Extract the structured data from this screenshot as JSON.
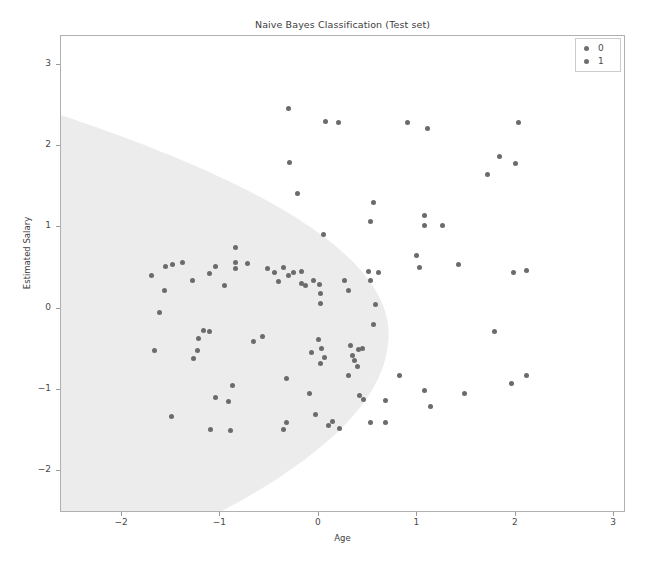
{
  "chart_data": {
    "type": "scatter",
    "title": "Naive Bayes Classification (Test set)",
    "xlabel": "Age",
    "ylabel": "Estimated Salary",
    "xlim": [
      -2.62,
      3.12
    ],
    "ylim": [
      -2.52,
      3.36
    ],
    "xticks": [
      "-2",
      "-1",
      "0",
      "1",
      "2",
      "3"
    ],
    "xtick_values": [
      -2,
      -1,
      0,
      1,
      2,
      3
    ],
    "yticks": [
      "-2",
      "-1",
      "0",
      "1",
      "2",
      "3"
    ],
    "ytick_values": [
      -2,
      -1,
      0,
      1,
      2,
      3
    ],
    "grid": false,
    "legend_position": "upper right",
    "legend": [
      {
        "label": "0",
        "color": "#6f6f6f"
      },
      {
        "label": "1",
        "color": "#6f6f6f"
      }
    ],
    "marker_color": "#6b6b6b",
    "marker_size_px": 5,
    "decision_region": {
      "class_0_fill": "#ececec",
      "class_1_fill": "#ffffff",
      "description": "Large shaded parabolic/elliptical region covering the left portion of the plot, apex near Age = 0.72 at Estimated Salary = -0.33; it meets the left frame edge near Estimated Salary = 2.35 on top and extends below the bottom frame edge."
    },
    "series": [
      {
        "name": "0",
        "color": "#6b6b6b",
        "points": [
          [
            -0.31,
            2.47
          ],
          [
            0.07,
            2.3
          ],
          [
            0.2,
            2.29
          ],
          [
            0.9,
            2.29
          ],
          [
            1.1,
            2.22
          ],
          [
            2.03,
            2.29
          ],
          [
            1.83,
            1.87
          ],
          [
            1.71,
            1.65
          ],
          [
            2.0,
            1.79
          ],
          [
            -0.3,
            1.8
          ],
          [
            -0.22,
            1.42
          ],
          [
            0.55,
            1.31
          ],
          [
            0.05,
            0.91
          ],
          [
            0.52,
            1.07
          ],
          [
            1.07,
            1.15
          ],
          [
            1.07,
            1.03
          ],
          [
            1.26,
            1.03
          ],
          [
            0.99,
            0.66
          ],
          [
            1.02,
            0.51
          ],
          [
            1.42,
            0.54
          ],
          [
            1.98,
            0.44
          ],
          [
            2.11,
            0.47
          ],
          [
            1.78,
            -0.28
          ],
          [
            0.82,
            -0.82
          ],
          [
            1.07,
            -1.01
          ],
          [
            1.13,
            -1.21
          ],
          [
            1.48,
            -1.05
          ],
          [
            0.68,
            -1.13
          ],
          [
            0.68,
            -1.41
          ],
          [
            1.96,
            -0.92
          ],
          [
            2.11,
            -0.82
          ]
        ]
      },
      {
        "name": "1",
        "color": "#6b6b6b",
        "points": [
          [
            -1.7,
            0.41
          ],
          [
            -1.56,
            0.52
          ],
          [
            -1.49,
            0.54
          ],
          [
            -1.39,
            0.57
          ],
          [
            -1.57,
            0.22
          ],
          [
            -1.62,
            -0.05
          ],
          [
            -1.67,
            -0.52
          ],
          [
            -1.5,
            -1.33
          ],
          [
            -1.28,
            0.35
          ],
          [
            -1.05,
            0.52
          ],
          [
            -1.11,
            0.43
          ],
          [
            -0.85,
            0.75
          ],
          [
            -0.85,
            0.57
          ],
          [
            -0.85,
            0.5
          ],
          [
            -0.73,
            0.55
          ],
          [
            -0.96,
            0.29
          ],
          [
            -1.17,
            -0.27
          ],
          [
            -1.11,
            -0.28
          ],
          [
            -1.22,
            -0.37
          ],
          [
            -1.23,
            -0.52
          ],
          [
            -1.27,
            -0.62
          ],
          [
            -1.05,
            -1.1
          ],
          [
            -1.1,
            -1.49
          ],
          [
            -0.88,
            -0.95
          ],
          [
            -0.92,
            -1.15
          ],
          [
            -0.9,
            -1.5
          ],
          [
            -0.66,
            -0.41
          ],
          [
            -0.57,
            -0.34
          ],
          [
            -0.52,
            0.49
          ],
          [
            -0.45,
            0.44
          ],
          [
            -0.41,
            0.33
          ],
          [
            -0.36,
            0.51
          ],
          [
            -0.31,
            0.41
          ],
          [
            -0.33,
            -0.86
          ],
          [
            -0.36,
            -1.49
          ],
          [
            -0.33,
            -1.41
          ],
          [
            -0.26,
            0.44
          ],
          [
            -0.18,
            0.46
          ],
          [
            -0.18,
            0.31
          ],
          [
            -0.14,
            0.29
          ],
          [
            -0.05,
            0.35
          ],
          [
            0.01,
            0.3
          ],
          [
            0.02,
            0.19
          ],
          [
            0.02,
            0.06
          ],
          [
            0.0,
            -0.38
          ],
          [
            0.03,
            -0.49
          ],
          [
            0.06,
            -0.6
          ],
          [
            0.02,
            -0.68
          ],
          [
            -0.08,
            -0.54
          ],
          [
            -0.1,
            -1.05
          ],
          [
            -0.03,
            -1.3
          ],
          [
            0.1,
            -1.44
          ],
          [
            0.14,
            -1.39
          ],
          [
            0.21,
            -1.48
          ],
          [
            0.26,
            0.35
          ],
          [
            0.3,
            0.22
          ],
          [
            0.32,
            -0.46
          ],
          [
            0.34,
            -0.58
          ],
          [
            0.36,
            -0.64
          ],
          [
            0.4,
            -0.5
          ],
          [
            0.44,
            -0.49
          ],
          [
            0.39,
            -0.72
          ],
          [
            0.45,
            -1.12
          ],
          [
            0.52,
            -1.4
          ],
          [
            0.5,
            0.46
          ],
          [
            0.52,
            0.34
          ],
          [
            0.61,
            0.45
          ],
          [
            0.58,
            0.05
          ],
          [
            0.55,
            -0.2
          ],
          [
            0.3,
            -0.83
          ],
          [
            0.41,
            -1.07
          ]
        ]
      }
    ]
  }
}
